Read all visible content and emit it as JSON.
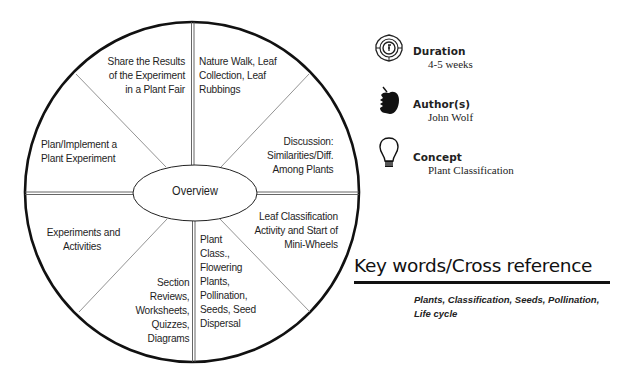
{
  "wheel": {
    "center_label": "Overview",
    "segments": [
      {
        "position": "top-left",
        "text": "Share the Results\nof the Experiment\nin a Plant Fair"
      },
      {
        "position": "top-right",
        "text": "Nature Walk, Leaf\nCollection, Leaf\nRubbings"
      },
      {
        "position": "right-upper",
        "text": "Discussion:\nSimilarities/Diff.\nAmong Plants"
      },
      {
        "position": "right-lower",
        "text": "Leaf Classification\nActivity and Start of\nMini-Wheels"
      },
      {
        "position": "bottom-right",
        "text": "Plant\nClass.,\nFlowering\nPlants,\nPollination,\nSeeds, Seed\nDispersal"
      },
      {
        "position": "bottom-left",
        "text": "Section\nReviews,\nWorksheets,\nQuizzes,\nDiagrams"
      },
      {
        "position": "left-lower",
        "text": "Experiments and\nActivities"
      },
      {
        "position": "left-upper",
        "text": "Plan/Implement a\nPlant Experiment"
      }
    ]
  },
  "meta": {
    "duration": {
      "icon": "clock-badge-icon",
      "title": "Duration",
      "value": "4-5 weeks"
    },
    "authors": {
      "icon": "apple-icon",
      "title": "Author(s)",
      "value": "John Wolf"
    },
    "concept": {
      "icon": "lightbulb-icon",
      "title": "Concept",
      "value": "Plant Classification"
    }
  },
  "keywords": {
    "title": "Key words/Cross reference",
    "text": "Plants, Classification, Seeds, Pollination, Life cycle"
  },
  "colors": {
    "ink": "#111111",
    "rule": "#9a9a9a",
    "background": "#ffffff"
  }
}
